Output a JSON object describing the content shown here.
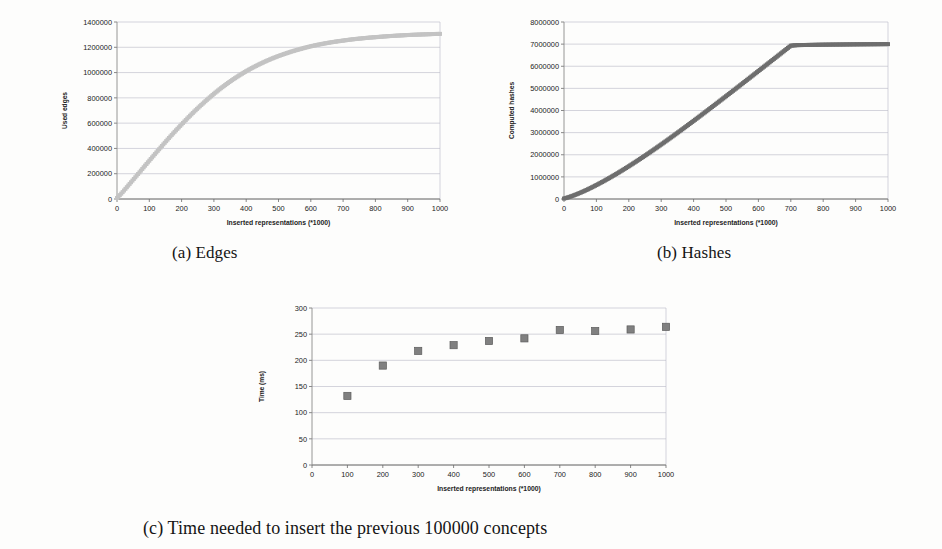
{
  "figure": {
    "captions": {
      "a": "(a) Edges",
      "b": "(b) Hashes",
      "c": "(c) Time needed to insert the previous 100000 concepts"
    }
  },
  "chart_data": [
    {
      "id": "edges",
      "type": "scatter",
      "title": "",
      "xlabel": "Inserted representations (*1000)",
      "ylabel": "Used edges",
      "xlim": [
        0,
        1000
      ],
      "ylim": [
        0,
        1400000
      ],
      "xticks": [
        0,
        100,
        200,
        300,
        400,
        500,
        600,
        700,
        800,
        900,
        1000
      ],
      "yticks": [
        0,
        200000,
        400000,
        600000,
        800000,
        1000000,
        1200000,
        1400000
      ],
      "xticklabels": [
        "0",
        "100",
        "200",
        "300",
        "400",
        "500",
        "600",
        "700",
        "800",
        "900",
        "1000"
      ],
      "yticklabels": [
        "0",
        "200000",
        "400000",
        "600000",
        "800000",
        "1000000",
        "1200000",
        "1400000"
      ],
      "grid": true,
      "marker_color": "#c3c3c3",
      "x": [
        0,
        10,
        20,
        30,
        40,
        50,
        60,
        70,
        80,
        90,
        100,
        120,
        140,
        160,
        180,
        200,
        220,
        240,
        260,
        280,
        300,
        320,
        340,
        360,
        380,
        400,
        420,
        440,
        460,
        480,
        500,
        520,
        540,
        560,
        580,
        600,
        620,
        640,
        660,
        680,
        700,
        720,
        740,
        760,
        780,
        800,
        820,
        840,
        860,
        880,
        900,
        920,
        940,
        960,
        980,
        1000
      ],
      "values": [
        8000,
        34000,
        62000,
        92000,
        122000,
        152000,
        182000,
        212000,
        243000,
        273000,
        303000,
        363000,
        422000,
        480000,
        536000,
        590000,
        643000,
        694000,
        742000,
        788000,
        832000,
        873000,
        911000,
        947000,
        980000,
        1011000,
        1039000,
        1065000,
        1089000,
        1111000,
        1131000,
        1149000,
        1166000,
        1181000,
        1195000,
        1208000,
        1219000,
        1229000,
        1238000,
        1246000,
        1253000,
        1260000,
        1266000,
        1271000,
        1276000,
        1280000,
        1284000,
        1288000,
        1291000,
        1294000,
        1297000,
        1299000,
        1301000,
        1303000,
        1305000,
        1306000
      ]
    },
    {
      "id": "hashes",
      "type": "scatter",
      "title": "",
      "xlabel": "Inserted representations (*1000)",
      "ylabel": "Computed hashes",
      "xlim": [
        0,
        1000
      ],
      "ylim": [
        0,
        8000000
      ],
      "xticks": [
        0,
        100,
        200,
        300,
        400,
        500,
        600,
        700,
        800,
        900,
        1000
      ],
      "yticks": [
        0,
        1000000,
        2000000,
        3000000,
        4000000,
        5000000,
        6000000,
        7000000,
        8000000
      ],
      "xticklabels": [
        "0",
        "100",
        "200",
        "300",
        "400",
        "500",
        "600",
        "700",
        "800",
        "900",
        "1000"
      ],
      "yticklabels": [
        "0",
        "1000000",
        "2000000",
        "3000000",
        "4000000",
        "5000000",
        "6000000",
        "7000000",
        "8000000"
      ],
      "grid": true,
      "marker_color": "#6e6e6e",
      "x": [
        0,
        10,
        20,
        30,
        40,
        50,
        60,
        70,
        80,
        90,
        100,
        120,
        140,
        160,
        180,
        200,
        220,
        240,
        260,
        280,
        300,
        320,
        340,
        360,
        380,
        400,
        420,
        440,
        460,
        480,
        500,
        520,
        540,
        560,
        580,
        600,
        620,
        640,
        660,
        680,
        700,
        720,
        740,
        760,
        780,
        800,
        820,
        840,
        860,
        880,
        900,
        920,
        940,
        960,
        980,
        1000
      ],
      "values": [
        20000,
        62000,
        110000,
        163000,
        220000,
        281000,
        345000,
        412000,
        482000,
        555000,
        630000,
        786000,
        950000,
        1120000,
        1297000,
        1480000,
        1668000,
        1861000,
        2058000,
        2259000,
        2464000,
        2672000,
        2883000,
        3097000,
        3313000,
        3531000,
        3751000,
        3973000,
        4196000,
        4420000,
        4645000,
        4871000,
        5098000,
        5326000,
        5554000,
        5783000,
        6012000,
        6241000,
        6470000,
        6700000,
        6930000,
        6955000,
        6960000,
        6965000,
        6970000,
        6975000,
        6978000,
        6981000,
        6984000,
        6987000,
        6990000,
        6992000,
        6994000,
        6996000,
        6998000,
        7000000
      ]
    },
    {
      "id": "time",
      "type": "scatter",
      "title": "",
      "xlabel": "Inserted representations (*1000)",
      "ylabel": "Time (ms)",
      "xlim": [
        0,
        1000
      ],
      "ylim": [
        0,
        300
      ],
      "xticks": [
        0,
        100,
        200,
        300,
        400,
        500,
        600,
        700,
        800,
        900,
        1000
      ],
      "yticks": [
        0,
        50,
        100,
        150,
        200,
        250,
        300
      ],
      "xticklabels": [
        "0",
        "100",
        "200",
        "300",
        "400",
        "500",
        "600",
        "700",
        "800",
        "900",
        "1000"
      ],
      "yticklabels": [
        "0",
        "50",
        "100",
        "150",
        "200",
        "250",
        "300"
      ],
      "grid": true,
      "marker_color": "#808080",
      "x": [
        100,
        200,
        300,
        400,
        500,
        600,
        700,
        800,
        900,
        1000
      ],
      "values": [
        132,
        190,
        218,
        229,
        237,
        242,
        258,
        256,
        259,
        264
      ]
    }
  ]
}
